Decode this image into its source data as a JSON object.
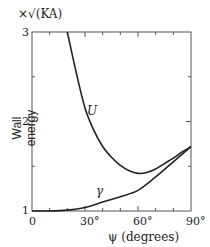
{
  "chart_data": {
    "type": "line",
    "title": "",
    "xlabel": "ψ (degrees)",
    "ylabel": "Wall energy",
    "yunit": "×√(KA)",
    "xlim": [
      0,
      90
    ],
    "ylim": [
      1,
      3
    ],
    "xticks": [
      "0",
      "30°",
      "60°",
      "90°"
    ],
    "yticks": [
      "1",
      "2",
      "3"
    ],
    "grid": false,
    "series": [
      {
        "name": "U",
        "x": [
          20,
          25,
          30,
          35,
          40,
          45,
          50,
          55,
          60,
          65,
          70,
          75,
          80,
          85,
          90
        ],
        "y": [
          3.0,
          2.55,
          2.15,
          1.9,
          1.72,
          1.6,
          1.51,
          1.45,
          1.42,
          1.43,
          1.47,
          1.53,
          1.59,
          1.66,
          1.72
        ]
      },
      {
        "name": "γ",
        "x": [
          0,
          10,
          20,
          30,
          40,
          50,
          60,
          70,
          80,
          90
        ],
        "y": [
          1.0,
          1.0,
          1.01,
          1.04,
          1.1,
          1.16,
          1.23,
          1.38,
          1.55,
          1.72
        ]
      }
    ],
    "annotations": [
      {
        "text": "U",
        "x": 37,
        "y": 2.3
      },
      {
        "text": "γ",
        "x": 33,
        "y": 1.14
      }
    ]
  }
}
